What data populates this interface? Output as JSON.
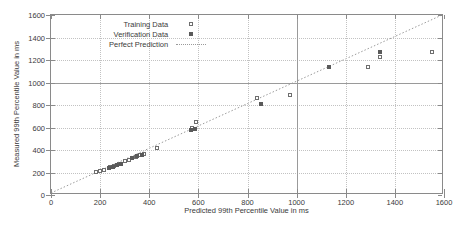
{
  "chart_data": {
    "type": "scatter",
    "title": "",
    "xlabel": "Predicted 99th Percentile Value in ms",
    "ylabel": "Measured 99th Percentile Value in ms",
    "xlim": [
      0,
      1600
    ],
    "ylim": [
      0,
      1600
    ],
    "xticks": [
      0,
      200,
      400,
      600,
      800,
      1000,
      1200,
      1400,
      1600
    ],
    "yticks": [
      0,
      200,
      400,
      600,
      800,
      1000,
      1200,
      1400,
      1600
    ],
    "grid": true,
    "emphasis_gridlines": {
      "x": 1000,
      "y": 1000
    },
    "legend_position": "top-left-inside",
    "legend": [
      {
        "label": "Training Data",
        "marker": "open-square"
      },
      {
        "label": "Verification Data",
        "marker": "filled-square"
      },
      {
        "label": "Perfect Prediction",
        "marker": "dotted-line"
      }
    ],
    "series": [
      {
        "name": "Training Data",
        "marker": "open-square",
        "points": [
          [
            185,
            205
          ],
          [
            200,
            210
          ],
          [
            215,
            222
          ],
          [
            240,
            245
          ],
          [
            258,
            255
          ],
          [
            275,
            278
          ],
          [
            300,
            300
          ],
          [
            318,
            312
          ],
          [
            345,
            340
          ],
          [
            362,
            352
          ],
          [
            380,
            368
          ],
          [
            430,
            415
          ],
          [
            575,
            600
          ],
          [
            590,
            645
          ],
          [
            840,
            860
          ],
          [
            975,
            890
          ],
          [
            1290,
            1140
          ],
          [
            1340,
            1230
          ],
          [
            1550,
            1270
          ]
        ]
      },
      {
        "name": "Verification Data",
        "marker": "filled-square",
        "points": [
          [
            235,
            240
          ],
          [
            252,
            250
          ],
          [
            268,
            268
          ],
          [
            285,
            275
          ],
          [
            330,
            325
          ],
          [
            352,
            348
          ],
          [
            372,
            360
          ],
          [
            570,
            575
          ],
          [
            585,
            585
          ],
          [
            855,
            805
          ],
          [
            1130,
            1140
          ],
          [
            1340,
            1270
          ]
        ]
      }
    ],
    "reference_line": {
      "name": "Perfect Prediction",
      "style": "dotted",
      "from": [
        0,
        0
      ],
      "to": [
        1600,
        1600
      ]
    }
  }
}
